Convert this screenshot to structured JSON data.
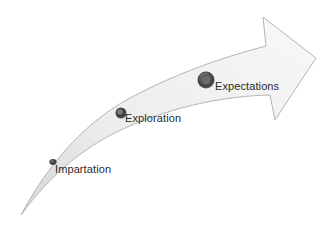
{
  "diagram": {
    "type": "curved-arrow-progression",
    "colors": {
      "arrow_fill_light": "#f7f7f7",
      "arrow_fill_dark": "#d9d9d9",
      "arrow_stroke": "#b8b8b8",
      "disc_dark": "#4a4a4a",
      "disc_mid": "#8a8a8a",
      "label_text": "#2a2a2a"
    },
    "stages": [
      {
        "label": "Impartation",
        "order": 1
      },
      {
        "label": "Exploration",
        "order": 2
      },
      {
        "label": "Expectations",
        "order": 3
      }
    ]
  }
}
